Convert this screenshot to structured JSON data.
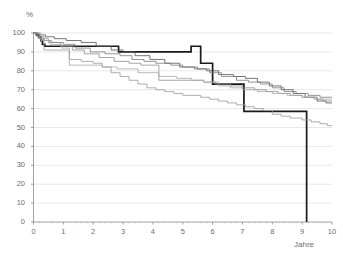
{
  "chart_data": {
    "type": "line",
    "title": "",
    "xlabel": "Jahre",
    "ylabel": "%",
    "xlim": [
      0,
      10
    ],
    "ylim": [
      0,
      100
    ],
    "grid": true,
    "legend": "none",
    "x_ticks": [
      "0",
      "1",
      "2",
      "3",
      "4",
      "5",
      "6",
      "7",
      "8",
      "9",
      "10"
    ],
    "y_ticks": [
      "0",
      "10",
      "20",
      "30",
      "40",
      "50",
      "60",
      "70",
      "80",
      "90",
      "100"
    ],
    "series": [
      {
        "name": "curve-bold-black",
        "color": "#1a1a1a",
        "width": 1.7,
        "step": "post",
        "points": [
          [
            0.0,
            100
          ],
          [
            0.1,
            99
          ],
          [
            0.18,
            98
          ],
          [
            0.25,
            96
          ],
          [
            0.3,
            94
          ],
          [
            0.38,
            93
          ],
          [
            2.8,
            93
          ],
          [
            2.85,
            90
          ],
          [
            5.25,
            90
          ],
          [
            5.28,
            93
          ],
          [
            5.55,
            93
          ],
          [
            5.6,
            84
          ],
          [
            5.95,
            84
          ],
          [
            6.0,
            73
          ],
          [
            7.0,
            73
          ],
          [
            7.05,
            58.5
          ],
          [
            9.12,
            58.5
          ],
          [
            9.15,
            0
          ],
          [
            9.15,
            0
          ]
        ]
      },
      {
        "name": "curve-gray-dark",
        "color": "#555555",
        "width": 0.8,
        "step": "post",
        "points": [
          [
            0.0,
            100
          ],
          [
            0.15,
            99
          ],
          [
            0.4,
            98
          ],
          [
            0.7,
            97
          ],
          [
            1.1,
            96
          ],
          [
            1.6,
            95
          ],
          [
            2.1,
            93
          ],
          [
            2.6,
            91
          ],
          [
            3.0,
            90
          ],
          [
            3.4,
            88
          ],
          [
            3.9,
            86
          ],
          [
            4.4,
            84
          ],
          [
            4.9,
            82
          ],
          [
            5.4,
            81
          ],
          [
            5.8,
            80
          ],
          [
            6.2,
            78
          ],
          [
            6.7,
            77
          ],
          [
            7.1,
            76
          ],
          [
            7.5,
            74
          ],
          [
            7.9,
            72
          ],
          [
            8.3,
            70
          ],
          [
            8.7,
            68
          ],
          [
            9.1,
            66
          ],
          [
            9.5,
            64
          ],
          [
            9.8,
            63
          ],
          [
            10.0,
            63
          ]
        ]
      },
      {
        "name": "curve-gray-mid-a",
        "color": "#7a7a7a",
        "width": 0.8,
        "step": "post",
        "points": [
          [
            0.0,
            100
          ],
          [
            0.12,
            98
          ],
          [
            0.35,
            96
          ],
          [
            0.6,
            95
          ],
          [
            1.0,
            94
          ],
          [
            1.4,
            92
          ],
          [
            1.9,
            90
          ],
          [
            2.4,
            89
          ],
          [
            2.9,
            88
          ],
          [
            3.3,
            86
          ],
          [
            3.7,
            85
          ],
          [
            4.1,
            84
          ],
          [
            4.6,
            83
          ],
          [
            5.0,
            82
          ],
          [
            5.5,
            81
          ],
          [
            5.9,
            79
          ],
          [
            6.3,
            77
          ],
          [
            6.8,
            75
          ],
          [
            7.2,
            74
          ],
          [
            7.6,
            73
          ],
          [
            8.0,
            71
          ],
          [
            8.4,
            69
          ],
          [
            8.8,
            68
          ],
          [
            9.2,
            67
          ],
          [
            9.6,
            66
          ],
          [
            10.0,
            66
          ]
        ]
      },
      {
        "name": "curve-gray-mid-b",
        "color": "#8e8e8e",
        "width": 0.8,
        "step": "post",
        "points": [
          [
            0.0,
            100
          ],
          [
            0.2,
            97
          ],
          [
            0.5,
            95
          ],
          [
            0.9,
            93
          ],
          [
            1.3,
            91
          ],
          [
            1.7,
            89
          ],
          [
            2.2,
            87
          ],
          [
            2.7,
            85
          ],
          [
            3.2,
            84
          ],
          [
            3.6,
            83
          ],
          [
            4.0,
            83
          ],
          [
            4.2,
            75
          ],
          [
            4.9,
            75
          ],
          [
            5.3,
            75
          ],
          [
            5.7,
            74
          ],
          [
            6.1,
            73
          ],
          [
            6.6,
            72
          ],
          [
            7.0,
            71
          ],
          [
            7.4,
            70
          ],
          [
            7.8,
            69
          ],
          [
            8.2,
            68
          ],
          [
            8.6,
            67
          ],
          [
            9.0,
            66
          ],
          [
            9.4,
            65
          ],
          [
            9.7,
            64
          ],
          [
            10.0,
            64
          ]
        ]
      },
      {
        "name": "curve-gray-light-a",
        "color": "#a8a8a8",
        "width": 0.8,
        "step": "post",
        "points": [
          [
            0.0,
            100
          ],
          [
            0.25,
            96
          ],
          [
            0.55,
            94
          ],
          [
            0.95,
            92
          ],
          [
            1.2,
            90
          ],
          [
            1.2,
            83
          ],
          [
            1.9,
            83
          ],
          [
            2.3,
            82
          ],
          [
            2.8,
            81
          ],
          [
            3.4,
            81
          ],
          [
            3.5,
            79
          ],
          [
            4.0,
            79
          ],
          [
            4.2,
            77
          ],
          [
            4.8,
            76
          ],
          [
            5.3,
            75
          ],
          [
            5.7,
            74
          ],
          [
            6.2,
            72
          ],
          [
            6.6,
            71
          ],
          [
            7.0,
            70
          ],
          [
            7.5,
            69
          ],
          [
            8.0,
            68
          ],
          [
            8.5,
            67
          ],
          [
            9.0,
            66
          ],
          [
            9.5,
            65
          ],
          [
            10.0,
            65
          ]
        ]
      },
      {
        "name": "curve-gray-lowest",
        "color": "#9b9b9b",
        "width": 0.8,
        "step": "post",
        "points": [
          [
            0.0,
            100
          ],
          [
            0.15,
            97
          ],
          [
            0.35,
            91
          ],
          [
            1.15,
            91
          ],
          [
            1.2,
            86
          ],
          [
            1.6,
            85
          ],
          [
            2.0,
            84
          ],
          [
            2.3,
            82
          ],
          [
            2.6,
            79
          ],
          [
            2.9,
            77
          ],
          [
            3.2,
            75
          ],
          [
            3.5,
            73
          ],
          [
            3.8,
            71
          ],
          [
            4.1,
            70
          ],
          [
            4.4,
            69
          ],
          [
            4.7,
            68
          ],
          [
            5.0,
            67
          ],
          [
            5.3,
            67
          ],
          [
            5.6,
            66
          ],
          [
            5.9,
            65
          ],
          [
            6.2,
            64
          ],
          [
            6.5,
            63
          ],
          [
            6.8,
            62
          ],
          [
            7.1,
            61
          ],
          [
            7.4,
            60
          ],
          [
            7.7,
            59
          ],
          [
            8.0,
            57
          ],
          [
            8.3,
            56
          ],
          [
            8.6,
            55
          ],
          [
            9.0,
            54
          ],
          [
            9.3,
            53
          ],
          [
            9.6,
            52
          ],
          [
            9.85,
            51
          ],
          [
            10.0,
            51
          ]
        ]
      }
    ]
  },
  "axes": {
    "y_axis_label": "%",
    "x_axis_label": "Jahre"
  }
}
